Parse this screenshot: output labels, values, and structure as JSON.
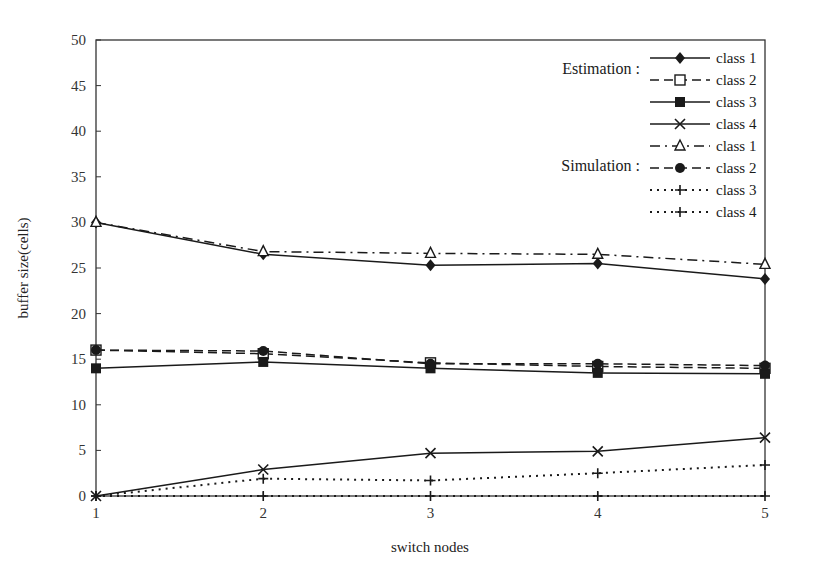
{
  "chart_data": {
    "type": "line",
    "title": "",
    "xlabel": "switch nodes",
    "ylabel": "buffer size(cells)",
    "x": [
      1,
      2,
      3,
      4,
      5
    ],
    "xticks": [
      "1",
      "2",
      "3",
      "4",
      "5"
    ],
    "yticks": [
      "0",
      "5",
      "10",
      "15",
      "20",
      "25",
      "30",
      "35",
      "40",
      "45",
      "50"
    ],
    "ylim": [
      0,
      50
    ],
    "xlim": [
      1,
      5
    ],
    "grid": false,
    "legend_position": "top-right inside",
    "legend_groups": [
      {
        "title": "Estimation :",
        "entries": [
          "class 1",
          "class 2",
          "class 3",
          "class 4"
        ]
      },
      {
        "title": "Simulation :",
        "entries": [
          "class 1",
          "class 2",
          "class 3",
          "class 4"
        ]
      }
    ],
    "series": [
      {
        "name": "Estimation class 1",
        "group": "Estimation",
        "label": "class 1",
        "line": "solid",
        "marker": "diamond-filled",
        "values": [
          30,
          26.5,
          25.3,
          25.5,
          23.8
        ]
      },
      {
        "name": "Estimation class 2",
        "group": "Estimation",
        "label": "class 2",
        "line": "dashed",
        "marker": "square-open",
        "values": [
          16,
          15.6,
          14.6,
          14.2,
          14.0
        ]
      },
      {
        "name": "Estimation class 3",
        "group": "Estimation",
        "label": "class 3",
        "line": "solid",
        "marker": "square-filled",
        "values": [
          14,
          14.7,
          14.0,
          13.5,
          13.4
        ]
      },
      {
        "name": "Estimation class 4",
        "group": "Estimation",
        "label": "class 4",
        "line": "solid",
        "marker": "x",
        "values": [
          0,
          2.9,
          4.7,
          4.9,
          6.4
        ]
      },
      {
        "name": "Simulation class 1",
        "group": "Simulation",
        "label": "class 1",
        "line": "dash-dot",
        "marker": "triangle-open",
        "values": [
          30,
          26.8,
          26.6,
          26.5,
          25.4
        ]
      },
      {
        "name": "Simulation class 2",
        "group": "Simulation",
        "label": "class 2",
        "line": "dashed",
        "marker": "circle-filled",
        "values": [
          16,
          15.9,
          14.5,
          14.5,
          14.3
        ]
      },
      {
        "name": "Simulation class 3",
        "group": "Simulation",
        "label": "class 3",
        "line": "dotted",
        "marker": "plus",
        "values": [
          0,
          1.9,
          1.7,
          2.5,
          3.4
        ]
      },
      {
        "name": "Simulation class 4",
        "group": "Simulation",
        "label": "class 4",
        "line": "dotted",
        "marker": "plus",
        "values": [
          0,
          0,
          0,
          0,
          0
        ]
      }
    ]
  },
  "legend": {
    "estimation_title": "Estimation :",
    "simulation_title": "Simulation :",
    "labels": [
      "class 1",
      "class 2",
      "class 3",
      "class 4",
      "class 1",
      "class 2",
      "class 3",
      "class 4"
    ]
  },
  "axes": {
    "xlabel": "switch nodes",
    "ylabel": "buffer size(cells)"
  },
  "colors": {
    "line": "#1a1a1a",
    "background": "#ffffff",
    "axis": "#333333"
  }
}
